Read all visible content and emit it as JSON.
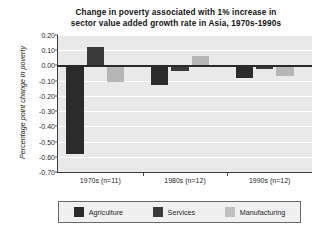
{
  "chart_data": {
    "type": "bar",
    "title": "Change in poverty associated with 1% increase in sector value added growth rate in Asia, 1970s-1990s",
    "title_lines": [
      "Change in poverty associated with 1% increase in",
      "sector value added growth rate in Asia, 1970s-1990s"
    ],
    "xlabel": "",
    "ylabel": "Percentage point change in poverty",
    "ylim": [
      -0.7,
      0.2
    ],
    "ytick_labels": [
      "0.20",
      "0.10",
      "0.00",
      "-0.10",
      "-0.20",
      "-0.30",
      "-0.40",
      "-0.50",
      "-0.60",
      "-0.70"
    ],
    "ytick_values": [
      0.2,
      0.1,
      0.0,
      -0.1,
      -0.2,
      -0.3,
      -0.4,
      -0.5,
      -0.6,
      -0.7
    ],
    "grid": true,
    "legend_position": "bottom",
    "categories": [
      "1970s  (n=11)",
      "1980s  (n=12)",
      "1990s  (n=12)"
    ],
    "series": [
      {
        "name": "Agriculture",
        "color": "#2b2b2b",
        "values": [
          -0.58,
          -0.13,
          -0.08
        ]
      },
      {
        "name": "Services",
        "color": "#3a3a3a",
        "values": [
          0.12,
          -0.035,
          -0.025
        ]
      },
      {
        "name": "Manufacturing",
        "color": "#b6b6b6",
        "values": [
          -0.11,
          0.065,
          -0.07
        ]
      }
    ]
  },
  "legend": {
    "entries": [
      {
        "label": "Agriculture",
        "key": "agriculture"
      },
      {
        "label": "Services",
        "key": "services"
      },
      {
        "label": "Manufacturing",
        "key": "manufacturing"
      }
    ]
  }
}
